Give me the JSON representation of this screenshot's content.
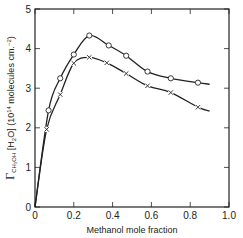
{
  "chart_data": {
    "type": "line",
    "title": "",
    "xlabel": "Methanol mole fraction",
    "ylabel": "Γ_CH3OH [H2O] (10^14 molecules cm.^-2)",
    "ylabel_parts": {
      "gamma": "Γ",
      "sub": "CH₃OH",
      "bracket": " [H",
      "h2o_sub": "2",
      "rest": "O] (10",
      "exp": "14",
      "units": " molecules cm.",
      "units_exp": "−2",
      "close": ")"
    },
    "xlim": [
      0,
      1.0
    ],
    "ylim": [
      0,
      5
    ],
    "x_ticks": [
      "0",
      "0.2",
      "0.4",
      "0.6",
      "0.8",
      "1.0"
    ],
    "y_ticks": [
      "0",
      "1",
      "2",
      "3",
      "4",
      "5"
    ],
    "grid": false,
    "legend": null,
    "series": [
      {
        "name": "circles",
        "marker": "circle",
        "x": [
          0.07,
          0.13,
          0.2,
          0.28,
          0.38,
          0.47,
          0.58,
          0.7,
          0.84
        ],
        "y": [
          2.44,
          3.25,
          3.85,
          4.33,
          4.08,
          3.82,
          3.42,
          3.25,
          3.14
        ],
        "curve_start": [
          0,
          0
        ],
        "curve_end": [
          0.9,
          3.1
        ]
      },
      {
        "name": "crosses",
        "marker": "x",
        "x": [
          0.06,
          0.13,
          0.2,
          0.28,
          0.37,
          0.47,
          0.58,
          0.7,
          0.84
        ],
        "y": [
          1.96,
          2.84,
          3.63,
          3.78,
          3.64,
          3.37,
          3.06,
          2.89,
          2.52
        ],
        "curve_start": [
          0,
          0
        ],
        "curve_end": [
          0.9,
          2.42
        ]
      }
    ]
  }
}
